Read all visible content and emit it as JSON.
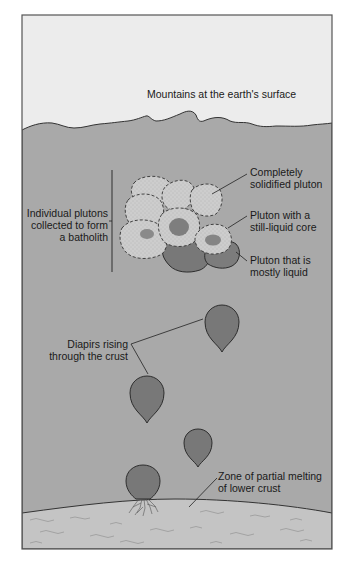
{
  "diagram": {
    "colors": {
      "sky": "#ececec",
      "crust": "#a9a9a9",
      "lower_crust": "#c4c4c4",
      "pluton_solid": "#cdcdcd",
      "pluton_liquid": "#787878",
      "frame": "#555555"
    },
    "labels": {
      "surface": "Mountains at the earth's surface",
      "batholith": [
        "Individual plutons",
        "collected to form",
        "a batholith"
      ],
      "solidified": [
        "Completely",
        "solidified pluton"
      ],
      "liquid_core": [
        "Pluton with a",
        "still-liquid core"
      ],
      "mostly_liquid": [
        "Pluton that is",
        "mostly liquid"
      ],
      "diapirs": [
        "Diapirs rising",
        "through the crust"
      ],
      "melting_zone": [
        "Zone of partial melting",
        "of lower crust"
      ]
    }
  }
}
